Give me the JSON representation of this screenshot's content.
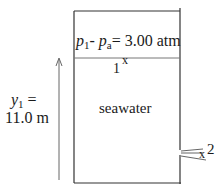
{
  "diagram": {
    "pressure_label": {
      "p": "p",
      "sub1": "1",
      "dash": "- ",
      "pa": "p",
      "suba": "a",
      "rest": "= 3.00 atm"
    },
    "point1_label": "1",
    "point1_marker": "x",
    "fluid_label": "seawater",
    "height_label": {
      "y": "y",
      "sub": "1",
      "eq": " =",
      "value": "11.0 m"
    },
    "point2_marker": "x",
    "point2_label": "2",
    "colors": {
      "stroke": "#333333",
      "surface_line": "#777777",
      "arrow": "#666666"
    }
  }
}
